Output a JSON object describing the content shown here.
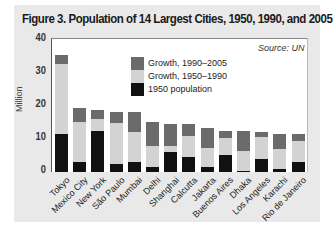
{
  "figure": {
    "title": "Figure 3. Population of 14 Largest Cities, 1950, 1990, and 2005",
    "source": "Source: UN",
    "ylabel": "Million"
  },
  "legend": [
    {
      "label": "Growth, 1990–2005",
      "color": "#6b6b6b"
    },
    {
      "label": "Growth, 1950–1990",
      "color": "#d3d3d3"
    },
    {
      "label": "1950 population",
      "color": "#111111"
    }
  ],
  "yticks": [
    "40",
    "30",
    "20",
    "10",
    "0"
  ],
  "chart_data": {
    "type": "bar",
    "stacked": true,
    "title": "Figure 3. Population of 14 Largest Cities, 1950, 1990, and 2005",
    "xlabel": "",
    "ylabel": "Million",
    "ylim": [
      0,
      40
    ],
    "yticks": [
      0,
      10,
      20,
      30,
      40
    ],
    "grid": false,
    "legend_position": "top-center",
    "annotations": [
      "Source: UN"
    ],
    "categories": [
      "Tokyo",
      "Mexico City",
      "New York",
      "São Paulo",
      "Mumbai",
      "Delhi",
      "Shanghai",
      "Calcutta",
      "Jakarta",
      "Buenos Aires",
      "Dhaka",
      "Los Angeles",
      "Karachi",
      "Rio de Janeiro"
    ],
    "series": [
      {
        "name": "1950 population",
        "color": "#111111",
        "values": [
          11.3,
          2.9,
          12.3,
          2.3,
          2.9,
          1.4,
          6.1,
          4.5,
          1.5,
          5.0,
          0.4,
          4.0,
          1.0,
          2.9
        ]
      },
      {
        "name": "Growth, 1950–1990",
        "color": "#d3d3d3",
        "values": [
          21.2,
          12.2,
          3.7,
          12.3,
          9.2,
          6.5,
          1.7,
          6.3,
          5.7,
          5.2,
          5.8,
          6.6,
          5.9,
          6.3
        ]
      },
      {
        "name": "Growth, 1990–2005",
        "color": "#6b6b6b",
        "values": [
          2.7,
          4.1,
          2.7,
          3.6,
          6.0,
          7.0,
          6.5,
          3.5,
          6.0,
          2.1,
          6.2,
          1.4,
          4.6,
          2.1
        ]
      }
    ],
    "totals_2005": [
      35.2,
      19.2,
      18.7,
      18.2,
      18.1,
      14.9,
      14.3,
      14.3,
      13.2,
      12.3,
      12.4,
      12.0,
      11.5,
      11.3
    ]
  }
}
